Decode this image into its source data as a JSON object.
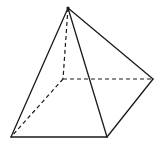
{
  "diagram": {
    "type": "square-pyramid",
    "stroke_color": "#1a1a1a",
    "background": "#ffffff",
    "vertices": {
      "apex": [
        68,
        8
      ],
      "back_left_hidden": [
        63,
        79
      ],
      "right": [
        153,
        79
      ],
      "front_right": [
        107,
        137
      ],
      "front_left": [
        11,
        137
      ]
    },
    "visible_edges": [
      [
        "apex",
        "front_left"
      ],
      [
        "apex",
        "front_right"
      ],
      [
        "apex",
        "right"
      ],
      [
        "front_left",
        "front_right"
      ],
      [
        "front_right",
        "right"
      ]
    ],
    "hidden_edges": [
      [
        "apex",
        "back_left_hidden"
      ],
      [
        "back_left_hidden",
        "right"
      ],
      [
        "back_left_hidden",
        "front_left"
      ]
    ]
  }
}
